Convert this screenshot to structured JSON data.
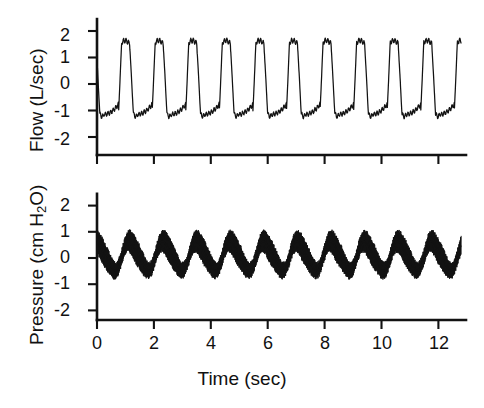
{
  "figure": {
    "background_color": "#ffffff",
    "trace_color": "#121212",
    "panels_count": 2
  },
  "chart_data": [
    {
      "type": "line",
      "title": "",
      "panel_name": "flow",
      "xlabel": "",
      "ylabel": "Flow (L/sec)",
      "xlim": [
        0,
        13.0
      ],
      "ylim": [
        -2.6,
        2.45
      ],
      "grid": false,
      "legend": "none",
      "xticks": [
        0,
        2,
        4,
        6,
        8,
        10,
        12
      ],
      "xticklabels": [
        "",
        "",
        "",
        "",
        "",
        "",
        ""
      ],
      "yticks": [
        2,
        1,
        0,
        -1,
        -2
      ],
      "yticklabels": [
        "2",
        "1",
        "0",
        "-1",
        "-2"
      ],
      "waveform": {
        "description": "Respiratory airflow, asymmetric breath cycles with serrated inspiratory plateau",
        "period_sec": 1.18,
        "cycles": 11,
        "peak_value": 1.62,
        "trough_value": -1.15,
        "start_value": -0.8,
        "end_time_sec": 12.8,
        "end_value": -0.35,
        "ripple_amplitude": 0.09,
        "ripple_freq_hz": 11.0
      }
    },
    {
      "type": "line",
      "title": "",
      "panel_name": "pressure",
      "xlabel": "Time (sec)",
      "ylabel": "Pressure (cm H2O)",
      "ylabel_display": "Pressure (cm H₂O)",
      "xlim": [
        0,
        13.0
      ],
      "ylim": [
        -2.6,
        2.45
      ],
      "grid": false,
      "legend": "none",
      "xticks": [
        0,
        2,
        4,
        6,
        8,
        10,
        12
      ],
      "xticklabels": [
        "0",
        "2",
        "4",
        "6",
        "8",
        "10",
        "12"
      ],
      "yticks": [
        2,
        1,
        0,
        -1,
        -2
      ],
      "yticklabels": [
        "2",
        "1",
        "0",
        "-1",
        "-2"
      ],
      "waveform": {
        "description": "Airway pressure: slow respiratory wave with superimposed dense high-frequency oscillations",
        "slow_period_sec": 1.18,
        "slow_amplitude": 0.62,
        "slow_offset": 0.08,
        "hf_amplitude": 0.45,
        "hf_freq_hz": 14.0,
        "envelope_max": 1.12,
        "envelope_min": -1.02,
        "end_time_sec": 12.8
      }
    }
  ],
  "axes_geometry": {
    "x_origin_px": 97,
    "x_per_sec_px": 28.45,
    "x_axis_right_px": 466,
    "flow_y_zero_px": 84,
    "flow_y_per_unit_px": 26.5,
    "flow_baseline_px": 155,
    "pressure_y_zero_px": 258,
    "pressure_y_per_unit_px": 26.2,
    "pressure_baseline_px": 320
  }
}
